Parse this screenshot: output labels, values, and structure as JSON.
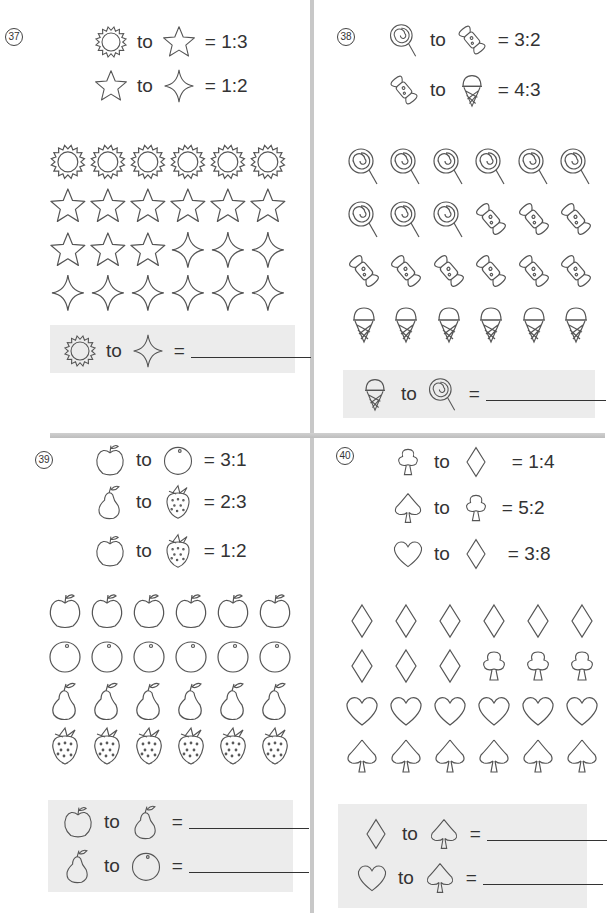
{
  "questions": [
    {
      "number": "37",
      "rules": [
        {
          "left": "sun",
          "to": "to",
          "right": "star",
          "ratio": "= 1:3"
        },
        {
          "left": "star",
          "to": "to",
          "right": "sparkle",
          "ratio": "= 1:2"
        }
      ],
      "grid": [
        [
          "sun",
          "sun",
          "sun",
          "sun",
          "sun",
          "sun"
        ],
        [
          "star",
          "star",
          "star",
          "star",
          "star",
          "star"
        ],
        [
          "star",
          "star",
          "star",
          "sparkle",
          "sparkle",
          "sparkle"
        ],
        [
          "sparkle",
          "sparkle",
          "sparkle",
          "sparkle",
          "sparkle",
          "sparkle"
        ]
      ],
      "answers": [
        {
          "left": "sun",
          "to": "to",
          "right": "sparkle",
          "eq": "=",
          "value": ""
        }
      ]
    },
    {
      "number": "38",
      "rules": [
        {
          "left": "lollipop",
          "to": "to",
          "right": "candy",
          "ratio": "= 3:2"
        },
        {
          "left": "candy",
          "to": "to",
          "right": "ice-cream",
          "ratio": "= 4:3"
        }
      ],
      "grid": [
        [
          "lollipop",
          "lollipop",
          "lollipop",
          "lollipop",
          "lollipop",
          "lollipop"
        ],
        [
          "lollipop",
          "lollipop",
          "lollipop",
          "candy",
          "candy",
          "candy"
        ],
        [
          "candy",
          "candy",
          "candy",
          "candy",
          "candy",
          "candy"
        ],
        [
          "ice-cream",
          "ice-cream",
          "ice-cream",
          "ice-cream",
          "ice-cream",
          "ice-cream"
        ]
      ],
      "answers": [
        {
          "left": "ice-cream",
          "to": "to",
          "right": "lollipop",
          "eq": "=",
          "value": ""
        }
      ]
    },
    {
      "number": "39",
      "rules": [
        {
          "left": "apple",
          "to": "to",
          "right": "orange",
          "ratio": "= 3:1"
        },
        {
          "left": "pear",
          "to": "to",
          "right": "strawberry",
          "ratio": "= 2:3"
        },
        {
          "left": "apple",
          "to": "to",
          "right": "strawberry",
          "ratio": "= 1:2"
        }
      ],
      "grid": [
        [
          "apple",
          "apple",
          "apple",
          "apple",
          "apple",
          "apple"
        ],
        [
          "orange",
          "orange",
          "orange",
          "orange",
          "orange",
          "orange"
        ],
        [
          "pear",
          "pear",
          "pear",
          "pear",
          "pear",
          "pear"
        ],
        [
          "strawberry",
          "strawberry",
          "strawberry",
          "strawberry",
          "strawberry",
          "strawberry"
        ]
      ],
      "answers": [
        {
          "left": "apple",
          "to": "to",
          "right": "pear",
          "eq": "=",
          "value": ""
        },
        {
          "left": "pear",
          "to": "to",
          "right": "orange",
          "eq": "=",
          "value": ""
        }
      ]
    },
    {
      "number": "40",
      "rules": [
        {
          "left": "club",
          "to": "to",
          "right": "diamond",
          "ratio": "= 1:4"
        },
        {
          "left": "spade",
          "to": "to",
          "right": "club",
          "ratio": "= 5:2"
        },
        {
          "left": "heart",
          "to": "to",
          "right": "diamond",
          "ratio": "= 3:8"
        }
      ],
      "grid": [
        [
          "diamond",
          "diamond",
          "diamond",
          "diamond",
          "diamond",
          "diamond"
        ],
        [
          "diamond",
          "diamond",
          "diamond",
          "club",
          "club",
          "club"
        ],
        [
          "heart",
          "heart",
          "heart",
          "heart",
          "heart",
          "heart"
        ],
        [
          "spade",
          "spade",
          "spade",
          "spade",
          "spade",
          "spade"
        ]
      ],
      "answers": [
        {
          "left": "diamond",
          "to": "to",
          "right": "spade",
          "eq": "=",
          "value": ""
        },
        {
          "left": "heart",
          "to": "to",
          "right": "spade",
          "eq": "=",
          "value": ""
        }
      ]
    }
  ],
  "colors": {
    "line": "#555555",
    "answer_bg": "#ececec",
    "divider": "#c8c8c8"
  }
}
